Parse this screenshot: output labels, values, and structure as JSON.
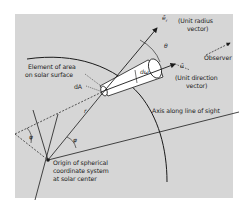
{
  "labels": {
    "element_line1": "Element of area",
    "element_line2": "on solar surface",
    "dA": "dA",
    "er_symbol": "ē",
    "er_sub": "r",
    "unit_radius_line1": "(Unit radius",
    "unit_radius_line2": "vector)",
    "theta": "θ",
    "observer": "Observer",
    "u_symbol": "ū",
    "unit_dir_line1": "(Unit direction",
    "unit_dir_line2": "vector)",
    "domega": "dω",
    "axis": "Axis along line of sight",
    "r": "r",
    "phi_left": "φ",
    "phi_right": "φ",
    "origin_line1": "Origin of spherical",
    "origin_line2": "coordinate system",
    "origin_line3": "at solar center"
  },
  "colors": {
    "panel": "#d6d6d6",
    "ink": "#1a1a1a",
    "cone": "#ffffff"
  }
}
